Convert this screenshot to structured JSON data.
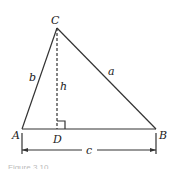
{
  "diagram": {
    "type": "triangle-with-altitude",
    "vertices": {
      "A": "A",
      "B": "B",
      "C": "C",
      "D": "D"
    },
    "sides": {
      "a": "a",
      "b": "b",
      "c": "c"
    },
    "altitude": "h",
    "caption": "Figure 3.10"
  }
}
